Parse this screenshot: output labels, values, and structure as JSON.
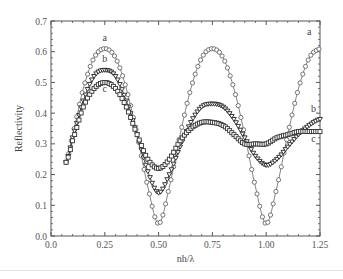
{
  "chart_data": {
    "type": "line",
    "title": "",
    "xlabel": "nh/λ",
    "ylabel": "Reflectivity",
    "xlim": [
      0.0,
      1.25
    ],
    "ylim": [
      0.0,
      0.7
    ],
    "xticks": [
      "0.0",
      "0.25",
      "0.50",
      "0.75",
      "1.00",
      "1.25"
    ],
    "yticks": [
      "0.0",
      "0.1",
      "0.2",
      "0.3",
      "0.4",
      "0.5",
      "0.6",
      "0.7"
    ],
    "grid": false,
    "legend": "inline curve labels (a, b, c)",
    "series": [
      {
        "name": "a",
        "marker": "circle",
        "x": [
          0.07,
          0.1,
          0.15,
          0.2,
          0.25,
          0.3,
          0.35,
          0.4,
          0.45,
          0.5,
          0.55,
          0.6,
          0.65,
          0.7,
          0.75,
          0.8,
          0.85,
          0.9,
          0.95,
          1.0,
          1.05,
          1.1,
          1.15,
          1.2,
          1.25
        ],
        "y": [
          0.24,
          0.33,
          0.48,
          0.58,
          0.61,
          0.58,
          0.48,
          0.33,
          0.16,
          0.04,
          0.16,
          0.33,
          0.48,
          0.58,
          0.61,
          0.58,
          0.48,
          0.33,
          0.16,
          0.04,
          0.16,
          0.33,
          0.48,
          0.58,
          0.61
        ]
      },
      {
        "name": "b",
        "marker": "triangle",
        "x": [
          0.07,
          0.1,
          0.15,
          0.2,
          0.25,
          0.3,
          0.35,
          0.4,
          0.45,
          0.5,
          0.55,
          0.6,
          0.65,
          0.7,
          0.75,
          0.8,
          0.85,
          0.9,
          0.95,
          1.0,
          1.05,
          1.1,
          1.15,
          1.2,
          1.25
        ],
        "y": [
          0.24,
          0.32,
          0.44,
          0.52,
          0.54,
          0.52,
          0.44,
          0.33,
          0.21,
          0.14,
          0.2,
          0.29,
          0.37,
          0.42,
          0.43,
          0.42,
          0.38,
          0.32,
          0.26,
          0.23,
          0.25,
          0.29,
          0.33,
          0.36,
          0.38
        ]
      },
      {
        "name": "c",
        "marker": "square",
        "x": [
          0.07,
          0.1,
          0.15,
          0.2,
          0.25,
          0.3,
          0.35,
          0.4,
          0.45,
          0.5,
          0.55,
          0.6,
          0.65,
          0.7,
          0.75,
          0.8,
          0.85,
          0.9,
          0.95,
          1.0,
          1.05,
          1.1,
          1.15,
          1.2,
          1.25
        ],
        "y": [
          0.24,
          0.31,
          0.42,
          0.48,
          0.5,
          0.48,
          0.42,
          0.33,
          0.25,
          0.22,
          0.25,
          0.31,
          0.35,
          0.37,
          0.37,
          0.36,
          0.33,
          0.3,
          0.3,
          0.3,
          0.32,
          0.33,
          0.34,
          0.34,
          0.34
        ]
      }
    ],
    "annotations": [
      {
        "text": "a",
        "x": 0.25,
        "y": 0.635
      },
      {
        "text": "b",
        "x": 0.25,
        "y": 0.565
      },
      {
        "text": "c",
        "x": 0.25,
        "y": 0.47
      },
      {
        "text": "a",
        "x": 1.2,
        "y": 0.655
      },
      {
        "text": "b",
        "x": 1.22,
        "y": 0.405
      },
      {
        "text": "c",
        "x": 1.22,
        "y": 0.305
      }
    ]
  },
  "style": {
    "axis_color": "#555555",
    "series_colors": {
      "a": "#666666",
      "b": "#222222",
      "c": "#333333"
    }
  }
}
